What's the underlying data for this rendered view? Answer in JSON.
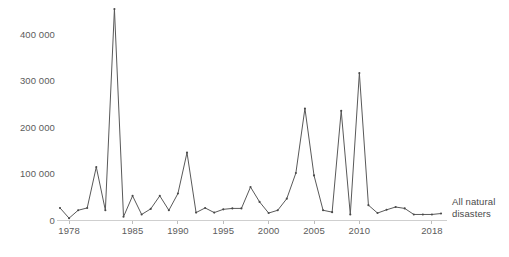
{
  "chart_data": {
    "type": "line",
    "title": "",
    "subtitle": "",
    "xlabel": "",
    "ylabel": "",
    "xlim": [
      1977,
      2019
    ],
    "ylim": [
      0,
      460000
    ],
    "grid": false,
    "legend_position": "right-inline",
    "series_label": "All natural disasters",
    "y_ticks": [
      0,
      100000,
      200000,
      300000,
      400000
    ],
    "y_tick_labels": [
      "0",
      "100 000",
      "200 000",
      "300 000",
      "400 000"
    ],
    "x_ticks": [
      1978,
      1985,
      1990,
      1995,
      2000,
      2005,
      2010,
      2018
    ],
    "x_tick_labels": [
      "1978",
      "1985",
      "1990",
      "1995",
      "2000",
      "2005",
      "2010",
      "2018"
    ],
    "x": [
      1977,
      1978,
      1979,
      1980,
      1981,
      1982,
      1983,
      1984,
      1985,
      1986,
      1987,
      1988,
      1989,
      1990,
      1991,
      1992,
      1993,
      1994,
      1995,
      1996,
      1997,
      1998,
      1999,
      2000,
      2001,
      2002,
      2003,
      2004,
      2005,
      2006,
      2007,
      2008,
      2009,
      2010,
      2011,
      2012,
      2013,
      2014,
      2015,
      2016,
      2017,
      2018,
      2019
    ],
    "values": [
      27000,
      5000,
      22000,
      27000,
      115000,
      22000,
      455000,
      8000,
      53000,
      13000,
      25000,
      53000,
      22000,
      58000,
      146000,
      17000,
      27000,
      17000,
      24000,
      26000,
      26000,
      72000,
      40000,
      16000,
      22000,
      47000,
      102000,
      241000,
      97000,
      22000,
      18000,
      236000,
      13000,
      317000,
      33000,
      16000,
      23000,
      29000,
      26000,
      13000,
      13000,
      13000,
      15000
    ],
    "series": [
      {
        "name": "All natural disasters",
        "color": "#595959",
        "values": [
          27000,
          5000,
          22000,
          27000,
          115000,
          22000,
          455000,
          8000,
          53000,
          13000,
          25000,
          53000,
          22000,
          58000,
          146000,
          17000,
          27000,
          17000,
          24000,
          26000,
          26000,
          72000,
          40000,
          16000,
          22000,
          47000,
          102000,
          241000,
          97000,
          22000,
          18000,
          236000,
          13000,
          317000,
          33000,
          16000,
          23000,
          29000,
          26000,
          13000,
          13000,
          13000,
          15000
        ]
      }
    ],
    "annotations": [
      {
        "text": "All natural disasters",
        "x": 2019,
        "y": 15000,
        "position": "right-of-last-point"
      }
    ],
    "colors": {
      "line": "#595959",
      "marker": "#4a4a4a",
      "axis": "#cfcfcf",
      "tick_label": "#5c5c5c",
      "background": "#ffffff"
    }
  },
  "annotation": {
    "line1": "All natural",
    "line2": "disasters"
  }
}
